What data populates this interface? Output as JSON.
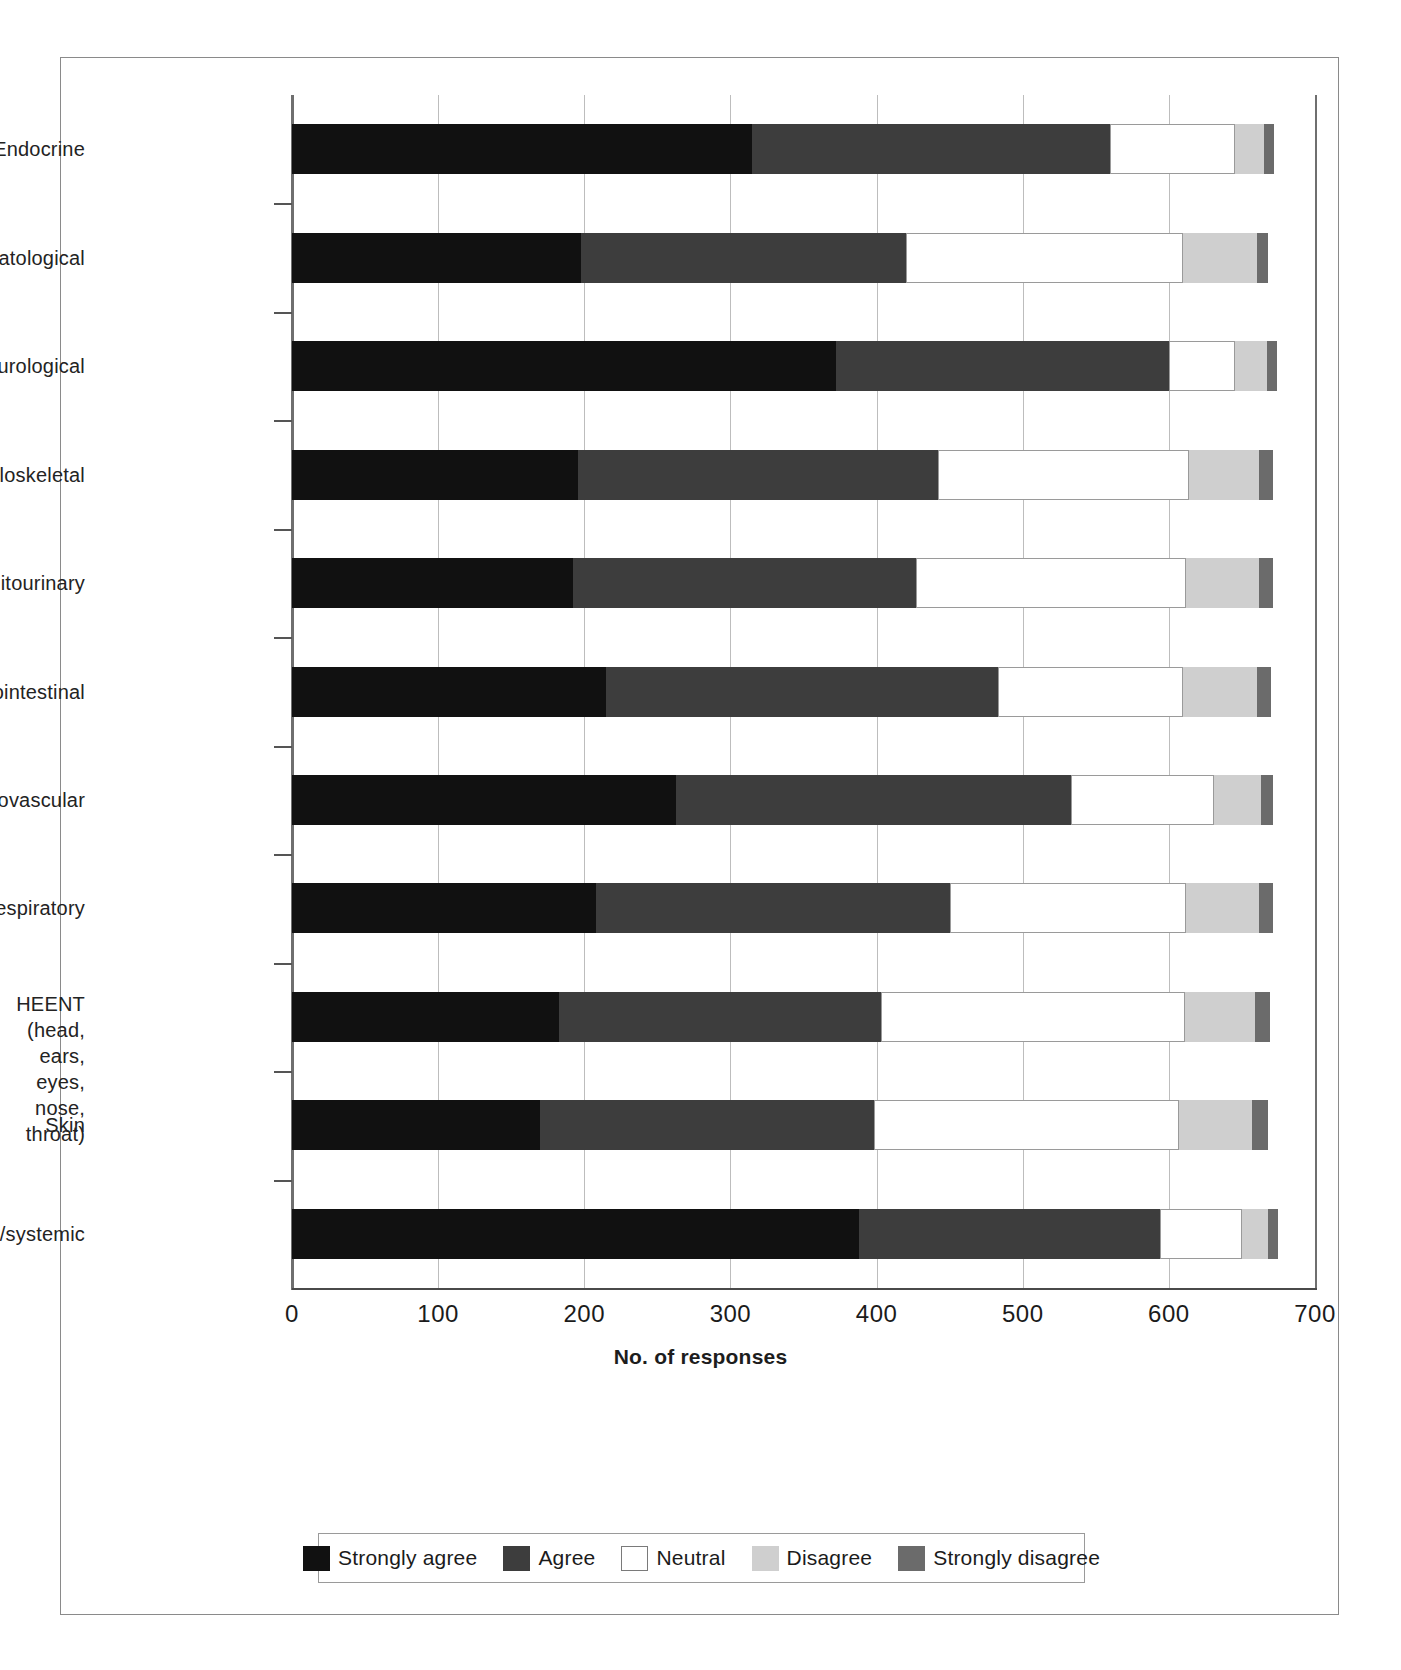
{
  "chart_data": {
    "type": "bar",
    "subtype": "horizontal stacked bar",
    "title": "",
    "xlabel": "No. of responses",
    "ylabel": "",
    "xlim": [
      0,
      700
    ],
    "xticks": [
      0,
      100,
      200,
      300,
      400,
      500,
      600,
      700
    ],
    "xtick_labels": [
      "0",
      "100",
      "200",
      "300",
      "400",
      "500",
      "600",
      "700"
    ],
    "grid": "vertical gridlines at each x tick",
    "legend_position": "bottom-center, boxed",
    "categories": [
      "Endocrine",
      "Hematological",
      "Neurological",
      "Musculoskeletal",
      "Genitourinary",
      "Gastrointestinal",
      "Cardiovascular",
      "Respiratory",
      "HEENT (head, ears, eyes,\nnose, throat)",
      "Skin",
      "General/systemic"
    ],
    "series": [
      {
        "name": "Strongly agree",
        "color": "#111111",
        "values": [
          315,
          198,
          372,
          196,
          192,
          215,
          263,
          208,
          183,
          170,
          388
        ]
      },
      {
        "name": "Agree",
        "color": "#3d3d3d",
        "values": [
          245,
          222,
          228,
          246,
          235,
          268,
          270,
          242,
          220,
          228,
          206
        ]
      },
      {
        "name": "Neutral",
        "color": "#ffffff",
        "values": [
          85,
          190,
          45,
          172,
          185,
          127,
          98,
          162,
          208,
          209,
          56
        ]
      },
      {
        "name": "Disagree",
        "color": "#cfcfcf",
        "values": [
          20,
          50,
          22,
          48,
          50,
          50,
          32,
          50,
          48,
          50,
          18
        ]
      },
      {
        "name": "Strongly disagree",
        "color": "#6b6b6b",
        "values": [
          7,
          8,
          7,
          9,
          9,
          10,
          8,
          9,
          10,
          11,
          7
        ]
      }
    ],
    "totals": [
      672,
      668,
      674,
      671,
      671,
      670,
      671,
      671,
      669,
      668,
      675
    ]
  },
  "axis": {
    "x_title": "No. of responses",
    "x_tick_labels": [
      "0",
      "100",
      "200",
      "300",
      "400",
      "500",
      "600",
      "700"
    ],
    "y_tick_labels": [
      "Endocrine",
      "Hematological",
      "Neurological",
      "Musculoskeletal",
      "Genitourinary",
      "Gastrointestinal",
      "Cardiovascular",
      "Respiratory",
      "HEENT (head, ears, eyes,\nnose, throat)",
      "Skin",
      "General/systemic"
    ]
  },
  "legend": {
    "items": [
      {
        "label": "Strongly agree",
        "color": "#111111",
        "key": "sa"
      },
      {
        "label": "Agree",
        "color": "#3d3d3d",
        "key": "ag"
      },
      {
        "label": "Neutral",
        "color": "#ffffff",
        "key": "nu"
      },
      {
        "label": "Disagree",
        "color": "#cfcfcf",
        "key": "di"
      },
      {
        "label": "Strongly disagree",
        "color": "#6b6b6b",
        "key": "sd"
      }
    ]
  },
  "colors": {
    "strongly_agree": "#111111",
    "agree": "#3d3d3d",
    "neutral": "#ffffff",
    "disagree": "#cfcfcf",
    "strongly_disagree": "#6b6b6b",
    "gridline": "#bdbdbd",
    "axis": "#6f6f6f",
    "frame": "#8a8a8a"
  }
}
